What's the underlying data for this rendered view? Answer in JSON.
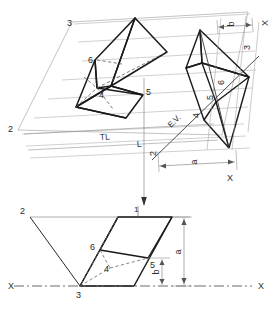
{
  "drawing": {
    "title": "Auxiliary view projection of solid 1-2-3-4-5-6",
    "colors": {
      "object_line": "#1a1a1a",
      "thin_line": "#8a8a8a",
      "hidden_line": "#6e6e6e",
      "label": "#2b2b2b",
      "background": "#ffffff"
    },
    "views": {
      "top_view": {
        "name": "auxiliary-top-view",
        "vertex_labels": [
          {
            "id": "v3",
            "text": "3"
          },
          {
            "id": "v2",
            "text": "2"
          },
          {
            "id": "v6",
            "text": "6"
          },
          {
            "id": "v4",
            "text": "4"
          },
          {
            "id": "v5",
            "text": "5"
          }
        ],
        "annotations": [
          {
            "id": "tl",
            "text": "TL"
          },
          {
            "id": "l",
            "text": "L"
          },
          {
            "id": "ev",
            "text": "E.V."
          },
          {
            "id": "n2",
            "text": "2"
          }
        ],
        "aux_vertex_labels": [
          {
            "id": "a3",
            "text": "3"
          },
          {
            "id": "a6",
            "text": "6"
          },
          {
            "id": "a5",
            "text": "5"
          },
          {
            "id": "a4",
            "text": "4"
          }
        ],
        "dimensions": [
          {
            "id": "dim-b-top",
            "text": "b"
          },
          {
            "id": "dim-a-top",
            "text": "a"
          }
        ],
        "reference_labels": [
          {
            "id": "x-top-right",
            "text": "X"
          },
          {
            "id": "x-bottom-right",
            "text": "X"
          }
        ]
      },
      "front_view": {
        "name": "front-elevation-view",
        "vertex_labels": [
          {
            "id": "f2",
            "text": "2"
          },
          {
            "id": "f3",
            "text": "3"
          },
          {
            "id": "f6",
            "text": "6"
          },
          {
            "id": "f4",
            "text": "4"
          },
          {
            "id": "f5",
            "text": "5"
          }
        ],
        "annotations": [
          {
            "id": "f1",
            "text": "1"
          }
        ],
        "dimensions": [
          {
            "id": "dim-a-front",
            "text": "a"
          },
          {
            "id": "dim-b-front",
            "text": "b"
          }
        ],
        "reference_labels": [
          {
            "id": "x-left",
            "text": "X"
          },
          {
            "id": "x-right",
            "text": "X"
          }
        ]
      }
    }
  }
}
